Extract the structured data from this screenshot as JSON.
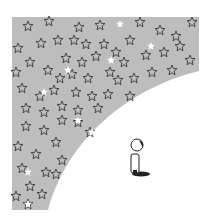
{
  "illustration": {
    "description": "Gray night sky full of outlined stars curving over a small figure looking up",
    "colors": {
      "sky": "#bdbdbd",
      "star_stroke": "#3a3a3a",
      "background": "#ffffff",
      "figure": "#222222"
    },
    "sky_region": {
      "left": 12,
      "top": 17,
      "right": 199,
      "bottom": 210
    }
  }
}
